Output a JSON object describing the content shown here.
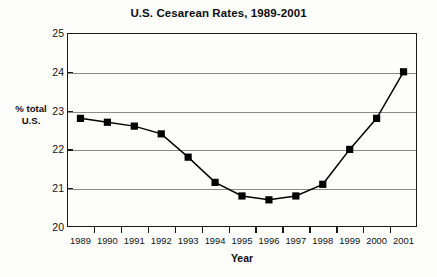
{
  "chart_data": {
    "type": "line",
    "title": "U.S. Cesarean Rates, 1989-2001",
    "xlabel": "Year",
    "ylabel": "% total U.S.",
    "ylabel_lines": [
      "% total",
      "U.S."
    ],
    "categories": [
      "1989",
      "1990",
      "1991",
      "1992",
      "1993",
      "1994",
      "1995",
      "1996",
      "1997",
      "1998",
      "1999",
      "2000",
      "2001"
    ],
    "values": [
      22.8,
      22.7,
      22.6,
      22.4,
      21.8,
      21.15,
      20.8,
      20.7,
      20.8,
      21.1,
      22.0,
      22.8,
      24.0
    ],
    "series": [
      {
        "name": "% total U.S.",
        "values": [
          22.8,
          22.7,
          22.6,
          22.4,
          21.8,
          21.15,
          20.8,
          20.7,
          20.8,
          21.1,
          22.0,
          22.8,
          24.0
        ]
      }
    ],
    "ylim": [
      20,
      25
    ],
    "xlim": [
      "1989",
      "2001"
    ],
    "y_ticks": [
      20,
      21,
      22,
      23,
      24,
      25
    ],
    "y_tick_labels": [
      "20",
      "21",
      "22",
      "23",
      "24",
      "25"
    ],
    "grid": true,
    "grid_axis": "y",
    "legend": false,
    "marker": "filled-square",
    "marker_color": "#000000",
    "line_color": "#000000",
    "background_color": "#ffffff",
    "axis_color": "#1a1a1a",
    "gridline_color": "#8a8a8a"
  }
}
